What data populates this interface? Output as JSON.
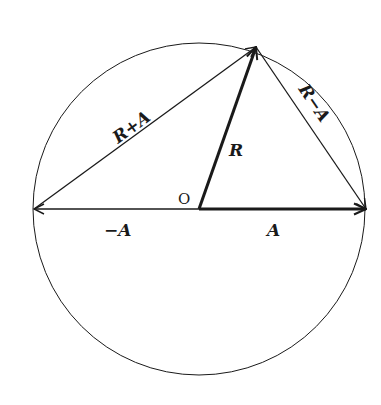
{
  "diagram": {
    "colors": {
      "stroke": "#1a1a1a",
      "background": "#ffffff"
    },
    "labels": {
      "origin": "O",
      "r_plus_a": "R+A",
      "r_minus_a": "R−A",
      "r": "R",
      "a": "A",
      "neg_a": "−A"
    },
    "geometry": {
      "circle": {
        "cx": 199,
        "cy": 209,
        "r": 166
      },
      "origin": [
        199,
        209
      ],
      "apex": [
        256,
        47
      ],
      "left_point": [
        34,
        209
      ],
      "right_point": [
        366,
        209
      ]
    },
    "vectors": [
      {
        "name": "R",
        "from": "origin",
        "to": "apex",
        "bold": true
      },
      {
        "name": "A",
        "from": "origin",
        "to": "right_point",
        "bold": true
      },
      {
        "name": "-A",
        "from": "origin",
        "to": "left_point",
        "bold": false
      },
      {
        "name": "R+A",
        "from": "left_point",
        "to": "apex",
        "bold": false
      },
      {
        "name": "R-A",
        "from": "apex",
        "to": "right_point",
        "bold": false
      }
    ]
  }
}
